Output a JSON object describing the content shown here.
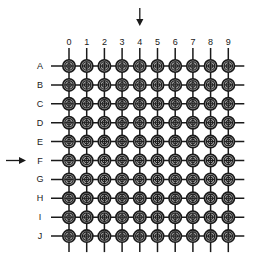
{
  "figure": {
    "type": "grid-diagram",
    "background_color": "#ffffff",
    "line_color": "#1a1a1a",
    "node_fill_color": "#a0a0a0",
    "node_stroke_color": "#1a1a1a",
    "label_color": "#1a1a1a"
  },
  "grid": {
    "columns": 10,
    "rows": 10,
    "column_labels": [
      "0",
      "1",
      "2",
      "3",
      "4",
      "5",
      "6",
      "7",
      "8",
      "9"
    ],
    "row_labels": [
      "A",
      "B",
      "C",
      "D",
      "E",
      "F",
      "G",
      "H",
      "I",
      "J"
    ],
    "origin_x": 69,
    "origin_y": 66,
    "step_x": 17.7,
    "step_y": 18.9,
    "node_outer_radius": 6.2,
    "node_mid_radius": 4.2,
    "node_inner_radius": 2.3,
    "line_overhang_start": 18,
    "line_overhang_end": 16
  },
  "pointers": {
    "column_arrow": {
      "name": "column-pointer-arrow",
      "direction": "down",
      "target_label": "4",
      "target_index": 4,
      "shaft_top": 8,
      "shaft_bottom": 26
    },
    "row_arrow": {
      "name": "row-pointer-arrow",
      "direction": "right",
      "target_label": "F",
      "target_index": 5,
      "shaft_left": 6,
      "shaft_right": 26
    }
  },
  "labels": {
    "column_axis_y": 37,
    "row_axis_x": 40
  }
}
